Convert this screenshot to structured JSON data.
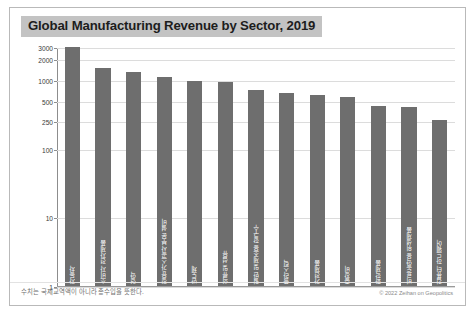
{
  "figure": {
    "title": "Global Manufacturing Revenue by Sector, 2019",
    "footnote": "수치는 국제교역액이 아니라 총수입을 뜻한다.",
    "copyright": "© 2022 Zeihan on Geopolitics",
    "colors": {
      "bar": "#6e6e6e",
      "title_highlight": "#c3c3c3",
      "grid": "#dcdcdc",
      "axis": "#8d8d8d",
      "border": "#b9b9b9"
    }
  },
  "chart_data": {
    "type": "bar",
    "title": "Global Manufacturing Revenue by Sector, 2019",
    "xlabel": "",
    "ylabel": "",
    "yscale": "log",
    "ylim": [
      1,
      3000
    ],
    "grid": true,
    "legend": false,
    "yticks": [
      3000,
      2000,
      1000,
      500,
      250,
      100,
      10,
      1
    ],
    "ytick_labels": [
      "3000",
      "2000",
      "1000",
      "500",
      "250",
      "100",
      "10",
      "1"
    ],
    "categories": [
      "자동차",
      "소비자 전자제품",
      "영약",
      "정유/가스공사 부문 설비",
      "반도체",
      "의류 및 섬유",
      "일반 및 제조용 항구수",
      "플라스틱",
      "가전제품",
      "중장비",
      "화학제품",
      "비료/농약용 위생제품",
      "컴퓨터 하드웨어"
    ],
    "values": [
      3000,
      1500,
      1300,
      1100,
      950,
      930,
      700,
      640,
      600,
      560,
      420,
      400,
      260
    ],
    "units": "billions USD"
  }
}
